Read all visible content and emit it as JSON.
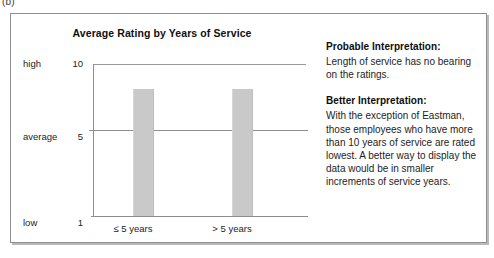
{
  "figure_label": "(b)",
  "chart_data": {
    "type": "bar",
    "title": "Average Rating by Years of Service",
    "xlabel": "",
    "ylabel": "",
    "categories": [
      "≤ 5 years",
      "> 5 years"
    ],
    "values": [
      8.3,
      8.3
    ],
    "ylim": [
      1,
      10
    ],
    "grid": true,
    "gridlines": [
      5
    ],
    "legend_position": "none",
    "y_ticks": [
      {
        "word": "high",
        "number": "10",
        "value": 10
      },
      {
        "word": "average",
        "number": "5",
        "value": 5
      },
      {
        "word": "low",
        "number": "1",
        "value": 1
      }
    ],
    "bar_color": "#c9c9c9",
    "axis_color": "#8d8d8d"
  },
  "interpretations": [
    {
      "heading": "Probable Interpretation:",
      "body": "Length of service has no bearing on the ratings."
    },
    {
      "heading": "Better Interpretation:",
      "body": "With the exception of Eastman, those employees who have more than 10 years of service are rated lowest. A better way to display the data would be in smaller increments of service years."
    }
  ]
}
